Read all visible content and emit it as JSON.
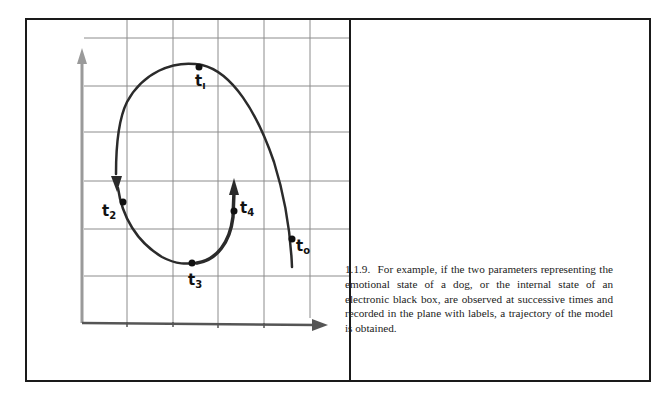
{
  "figure": {
    "axes": {
      "x_axis_color": "#555555",
      "y_axis_color": "#9a9a9a",
      "grid_color": "#8c8c8c",
      "curve_color": "#2b2b2b"
    },
    "points": [
      {
        "label": "t",
        "sub": "0",
        "x": 290,
        "y": 237
      },
      {
        "label": "t",
        "sub": "1",
        "x": 197,
        "y": 65
      },
      {
        "label": "t",
        "sub": "2",
        "x": 121,
        "y": 200
      },
      {
        "label": "t",
        "sub": "3",
        "x": 190,
        "y": 261
      },
      {
        "label": "t",
        "sub": "4",
        "x": 232,
        "y": 209
      }
    ]
  },
  "caption": {
    "number": "1.1.9.",
    "text": "For example, if the two parameters representing the emotional state of a dog, or the internal state of an electronic black box, are observed at successive times and recorded in the plane with labels, a trajectory of the model is obtained."
  }
}
